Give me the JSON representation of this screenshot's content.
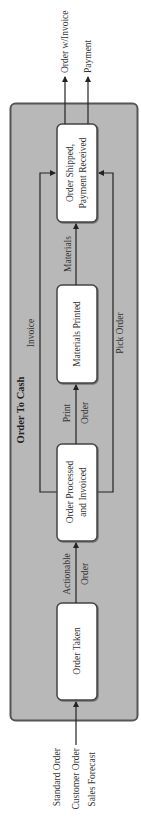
{
  "diagram": {
    "title": "Order To Cash",
    "colors": {
      "container_fill": "#b8b8b8",
      "container_border": "#555555",
      "box_fill": "#ffffff",
      "line": "#222222"
    },
    "inputs": [
      "Standard Order",
      "Customer Order",
      "Sales Forecast"
    ],
    "outputs": [
      "Order w/Invoice",
      "Payment"
    ],
    "steps": [
      {
        "id": "order-taken",
        "lines": [
          "Order Taken"
        ]
      },
      {
        "id": "order-processed",
        "lines": [
          "Order Processed",
          "and Invoiced"
        ]
      },
      {
        "id": "materials-printed",
        "lines": [
          "Materials Printed"
        ]
      },
      {
        "id": "order-shipped",
        "lines": [
          "Order Shipped,",
          "Payment Received"
        ]
      }
    ],
    "flows": {
      "actionable_order": [
        "Actionable",
        "Order"
      ],
      "print_order": [
        "Print",
        "Order"
      ],
      "materials": "Materials",
      "invoice": "Invoice",
      "pick_order": "Pick Order"
    }
  }
}
